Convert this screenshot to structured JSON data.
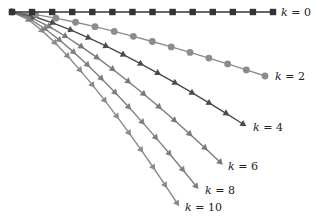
{
  "chart_data": {
    "type": "line",
    "title": "",
    "xlabel": "",
    "ylabel": "",
    "grid": false,
    "legend": "inline labels at curve ends",
    "origin_px": [
      12,
      12
    ],
    "series": [
      {
        "name": "k = 0",
        "k": 0,
        "marker": "square",
        "color": "#333333",
        "end_px": [
          273,
          12
        ],
        "bend": 0.0
      },
      {
        "name": "k = 2",
        "k": 2,
        "marker": "circle",
        "color": "#8c8c8c",
        "end_px": [
          265,
          76
        ],
        "bend": 0.55
      },
      {
        "name": "k = 4",
        "k": 4,
        "marker": "triangle-right",
        "color": "#4a4a4a",
        "end_px": [
          243,
          124
        ],
        "bend": 0.6
      },
      {
        "name": "k = 6",
        "k": 6,
        "marker": "triangle-down",
        "color": "#7a7a7a",
        "end_px": [
          220,
          162
        ],
        "bend": 0.65
      },
      {
        "name": "k = 8",
        "k": 8,
        "marker": "triangle-down",
        "color": "#7f7f7f",
        "end_px": [
          196,
          186
        ],
        "bend": 0.7
      },
      {
        "name": "k = 10",
        "k": 10,
        "marker": "triangle-down",
        "color": "#8a8a8a",
        "end_px": [
          177,
          203
        ],
        "bend": 0.75
      }
    ],
    "points_per_series": 14
  },
  "labels": [
    {
      "text_k": "k",
      "text_rest": " = 0",
      "x": 281,
      "y": 16
    },
    {
      "text_k": "k",
      "text_rest": " = 2",
      "x": 275,
      "y": 80
    },
    {
      "text_k": "k",
      "text_rest": " = 4",
      "x": 253,
      "y": 131
    },
    {
      "text_k": "k",
      "text_rest": " = 6",
      "x": 228,
      "y": 170
    },
    {
      "text_k": "k",
      "text_rest": " = 8",
      "x": 205,
      "y": 194
    },
    {
      "text_k": "k",
      "text_rest": " = 10",
      "x": 185,
      "y": 211
    }
  ]
}
